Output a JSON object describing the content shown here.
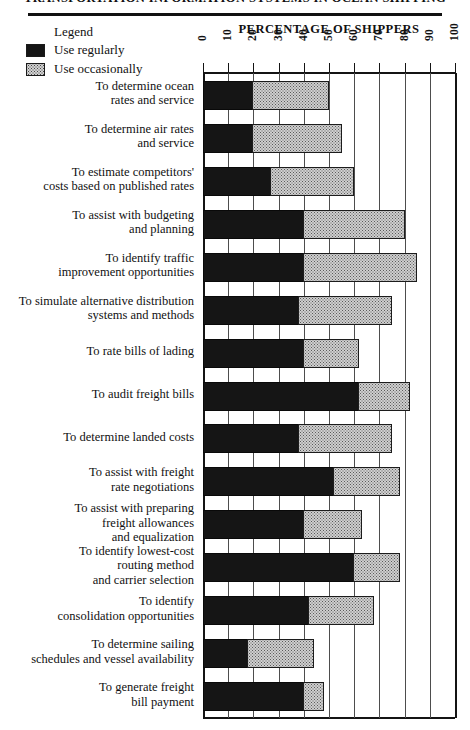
{
  "page": {
    "running_head": "TRANSPORTATION INFORMATION SYSTEMS IN OCEAN SHIPPING"
  },
  "legend": {
    "title": "Legend",
    "items": [
      {
        "label": "Use regularly",
        "pattern": "solid-black",
        "color": "#151515"
      },
      {
        "label": "Use occasionally",
        "pattern": "dotted-gray",
        "color": "#cfcfcf"
      }
    ]
  },
  "chart_data": {
    "type": "bar",
    "orientation": "horizontal",
    "stacked": true,
    "title": "PERCENTAGE OF SHIPPERS",
    "xlabel": "PERCENTAGE OF SHIPPERS",
    "ylabel": "",
    "xlim": [
      0,
      100
    ],
    "xticks": [
      0,
      10,
      20,
      30,
      40,
      50,
      60,
      70,
      80,
      90,
      100
    ],
    "xtick_labels": [
      "0",
      "10",
      "20",
      "30",
      "40",
      "50",
      "60",
      "70",
      "80",
      "90",
      "100"
    ],
    "grid": true,
    "legend_position": "top-left",
    "categories": [
      "To determine ocean\nrates and service",
      "To determine air rates\nand service",
      "To estimate competitors'\ncosts based on published rates",
      "To assist with budgeting\nand planning",
      "To identify traffic\nimprovement opportunities",
      "To simulate alternative distribution\nsystems and methods",
      "To rate bills of lading",
      "To audit freight bills",
      "To determine landed costs",
      "To assist with freight\nrate negotiations",
      "To assist with preparing\nfreight allowances\nand equalization",
      "To identify lowest-cost\nrouting method\nand carrier selection",
      "To identify\nconsolidation opportunities",
      "To determine sailing\nschedules and vessel availability",
      "To generate freight\nbill payment"
    ],
    "series": [
      {
        "name": "Use regularly",
        "color": "#151515",
        "values": [
          20,
          20,
          27,
          40,
          40,
          38,
          40,
          62,
          38,
          52,
          40,
          60,
          42,
          18,
          40
        ]
      },
      {
        "name": "Use occasionally",
        "color": "#cfcfcf",
        "values": [
          30,
          35,
          33,
          40,
          45,
          37,
          22,
          20,
          37,
          26,
          23,
          18,
          26,
          26,
          8
        ]
      }
    ],
    "totals": [
      50,
      55,
      60,
      80,
      85,
      75,
      62,
      82,
      75,
      78,
      63,
      78,
      68,
      44,
      48
    ]
  }
}
